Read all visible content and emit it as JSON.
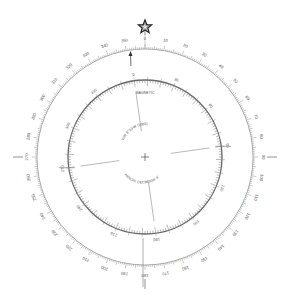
{
  "diagram": {
    "title": "Compass Rose",
    "center": {
      "x": 145,
      "y": 157
    },
    "true_ring": {
      "radius": 108,
      "labels": [
        "0",
        "10",
        "20",
        "30",
        "40",
        "50",
        "60",
        "70",
        "80",
        "90",
        "100",
        "110",
        "120",
        "130",
        "140",
        "150",
        "160",
        "170",
        "180",
        "190",
        "200",
        "210",
        "220",
        "230",
        "240",
        "250",
        "260",
        "270",
        "280",
        "290",
        "300",
        "310",
        "320",
        "330",
        "340",
        "350"
      ]
    },
    "magnetic_ring": {
      "radius": 77,
      "rotation_deg": -8,
      "labels": [
        "0",
        "30",
        "60",
        "90",
        "120",
        "150",
        "180",
        "210",
        "240",
        "270",
        "300",
        "330"
      ],
      "title": "MAGNETIC"
    },
    "center_text": {
      "variation": "VAR 8°23'W (1985)",
      "annual_change": "ANNUAL DECREASE 8'"
    },
    "north_star": "★",
    "colors": {
      "line": "#777777",
      "text": "#555555",
      "star": "#222222"
    }
  }
}
